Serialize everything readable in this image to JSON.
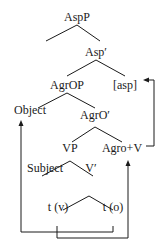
{
  "tree": {
    "nodes": {
      "aspp": "AspP",
      "asp_bar": "Asp′",
      "agrop": "AgrOP",
      "asp_feature": "[asp]",
      "object": "Object",
      "agro_bar": "AgrO′",
      "vp": "VP",
      "agro_v": "Agro+V",
      "subject": "Subject",
      "v_bar": "V′",
      "trace_v": "t (v)",
      "trace_o": "t (o)"
    },
    "movements": [
      {
        "from": "trace_v",
        "to": "agro_v"
      },
      {
        "from": "agro_v",
        "to": "asp_feature"
      },
      {
        "from": "trace_o",
        "to": "object"
      }
    ],
    "colors": {
      "line": "#1a1a1a",
      "background": "#ffffff"
    }
  }
}
